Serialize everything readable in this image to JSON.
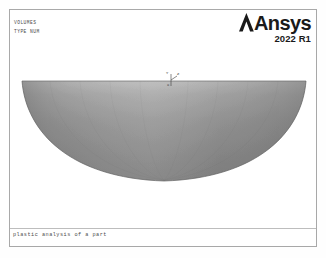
{
  "window": {
    "app": "Ansys Mechanical APDL Graphics",
    "background_color": "#ffffff",
    "frame_color": "#a8a8a8"
  },
  "legend": {
    "lines": [
      {
        "text": "VOLUMES"
      },
      {
        "text": "TYPE NUM"
      }
    ]
  },
  "brand": {
    "name": "Ansys",
    "version": "2022 R1",
    "logo_icon": "ansys-chevron-icon",
    "color": "#1a1a1a"
  },
  "geometry": {
    "name": "volume-plot",
    "description": "shallow bowl / hemispherical dish volume, flat top face, curved lower surface",
    "shade_light": "#b4b4b4",
    "shade_mid": "#909090",
    "shade_dark": "#6e6e6e",
    "edge_color": "#5a5a5a",
    "top_edge_y": 71,
    "bottom_apex_y": 171,
    "left_x": 12,
    "right_x": 296
  },
  "axis_triad": {
    "name": "coordinate-triad",
    "labels": [
      {
        "axis": "Y",
        "text": "Y"
      },
      {
        "axis": "Z",
        "text": "Z"
      },
      {
        "axis": "X",
        "text": "X"
      }
    ]
  },
  "footer": {
    "caption": "plastic analysis of a part",
    "divider_color": "#bdbdbd"
  }
}
